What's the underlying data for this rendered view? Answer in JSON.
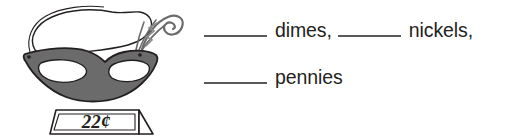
{
  "item": {
    "type": "coin-counting-worksheet-item",
    "illustration": {
      "name": "masquerade-mask",
      "alt_text": "masquerade mask with feather plume and tie string",
      "colors": {
        "mask_body": "#6b6b6b",
        "mask_outline": "#231f20",
        "eye_hole": "#ffffff",
        "hood": "#ffffff",
        "feather": "#9a9a9a",
        "tag_fill": "#ffffff",
        "tag_outline": "#231f20"
      }
    },
    "price_tag": {
      "name": "price-tag",
      "value": "22¢",
      "amount": 22,
      "currency_symbol": "¢"
    },
    "prompt": {
      "lines": [
        {
          "blanks": [
            {
              "label": "dimes,"
            },
            {
              "label": "nickels,"
            }
          ]
        },
        {
          "blanks": [
            {
              "label": "pennies"
            }
          ]
        }
      ],
      "blank_value": ""
    }
  }
}
